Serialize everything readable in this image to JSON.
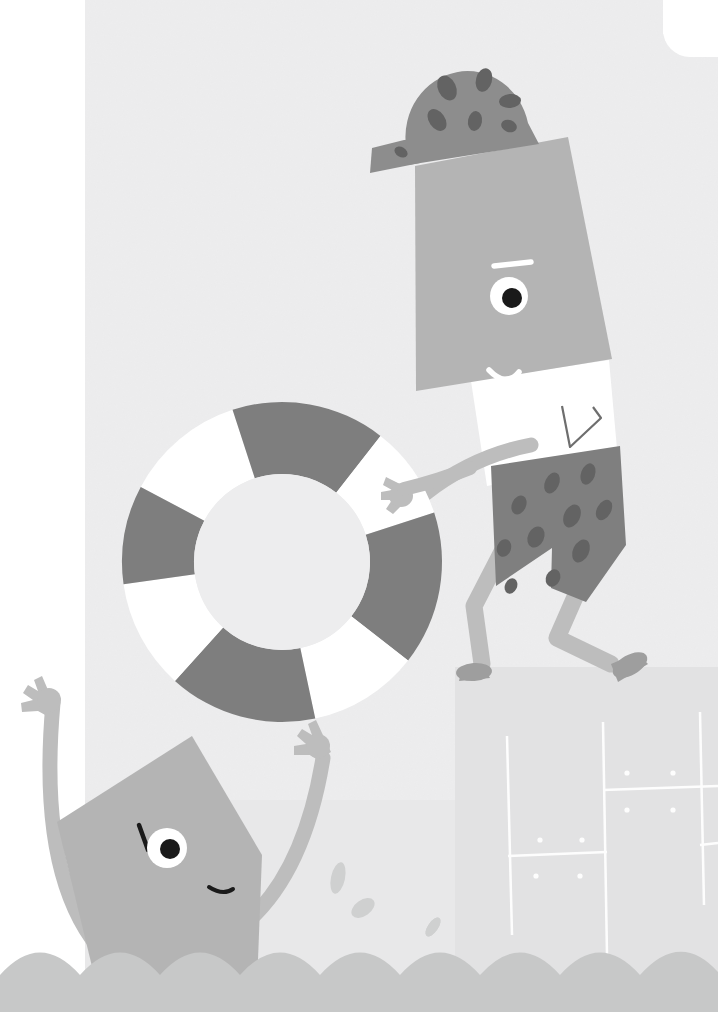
{
  "illustration": {
    "title": "Swimmers at the Pool with Life Ring",
    "scene_description": "Flat vector illustration: a character in spotted swim trunks and spotted cap steps off a pool deck holding a life ring while a second character in the water waves with both arms raised.",
    "canvas": {
      "width": 718,
      "height": 1012
    },
    "palette": {
      "page_white": "#ffffff",
      "background_paper": "#ededee",
      "deck_surface": "#e2e2e3",
      "water_light": "#e8e8e9",
      "wave_band": "#c7c8c8",
      "body_mid_gray": "#b4b4b4",
      "limb_gray": "#bdbdbd",
      "cap_gray": "#8d8d8d",
      "trunks_gray": "#7f7f7f",
      "spot_dark": "#636363",
      "ring_dark": "#7e7e7e",
      "ring_light": "#ffffff",
      "eye_white": "#ffffff",
      "pupil_black": "#1a1a1a",
      "brow_white": "#ffffff",
      "splash_gray": "#cfd0d0",
      "deck_line_white": "#ffffff"
    },
    "elements": [
      {
        "name": "background-paper",
        "label": "Textured off-white background panel"
      },
      {
        "name": "left-white-margin",
        "label": "White vertical margin strip on left edge"
      },
      {
        "name": "top-right-white-notch",
        "label": "White rounded notch in the top right corner"
      },
      {
        "name": "pool-deck",
        "label": "Pool deck platform with tile grid"
      },
      {
        "name": "deck-tile-grid",
        "label": "White tile lines and dot markers on the deck"
      },
      {
        "name": "water-surface",
        "label": "Light water surface band"
      },
      {
        "name": "wave-band",
        "label": "Scalloped wave band along the bottom"
      },
      {
        "name": "life-ring",
        "label": "Life preserver ring with four dark and four white segments"
      },
      {
        "name": "diver-character",
        "label": "Standing character stepping off the deck"
      },
      {
        "name": "diver-cap",
        "label": "Spotted swim cap"
      },
      {
        "name": "diver-eye",
        "label": "Round eye with black pupil"
      },
      {
        "name": "diver-eyebrow",
        "label": "White angled eyebrow"
      },
      {
        "name": "diver-smile",
        "label": "White curved smile"
      },
      {
        "name": "diver-collar",
        "label": "White collar / shirt wedge"
      },
      {
        "name": "diver-trunks",
        "label": "Dark spotted swim trunks"
      },
      {
        "name": "diver-arm",
        "label": "Arm reaching toward the life ring"
      },
      {
        "name": "diver-legs",
        "label": "Two bent legs with feet"
      },
      {
        "name": "swimmer-character",
        "label": "Character in the water with arms raised"
      },
      {
        "name": "swimmer-eye",
        "label": "Round eye with black pupil"
      },
      {
        "name": "swimmer-eyebrow",
        "label": "Dark angled eyebrow"
      },
      {
        "name": "swimmer-smile",
        "label": "Dark curved smile"
      },
      {
        "name": "swimmer-left-arm",
        "label": "Raised left arm with open hand"
      },
      {
        "name": "swimmer-right-arm",
        "label": "Raised right arm reaching the ring"
      },
      {
        "name": "splash-droplets",
        "label": "Three teardrop water droplets"
      }
    ],
    "ring_segments": [
      {
        "index": 0,
        "color": "#ffffff",
        "start_deg": -62,
        "end_deg": -18
      },
      {
        "index": 1,
        "color": "#7e7e7e",
        "start_deg": -18,
        "end_deg": 38
      },
      {
        "index": 2,
        "color": "#ffffff",
        "start_deg": 38,
        "end_deg": 72
      },
      {
        "index": 3,
        "color": "#7e7e7e",
        "start_deg": 72,
        "end_deg": 128
      },
      {
        "index": 4,
        "color": "#ffffff",
        "start_deg": 128,
        "end_deg": 168
      },
      {
        "index": 5,
        "color": "#7e7e7e",
        "start_deg": 168,
        "end_deg": 222
      },
      {
        "index": 6,
        "color": "#ffffff",
        "start_deg": 222,
        "end_deg": 262
      },
      {
        "index": 7,
        "color": "#7e7e7e",
        "start_deg": 262,
        "end_deg": 298
      }
    ],
    "cap_spots": [
      {
        "cx": 447,
        "cy": 88,
        "rx": 9,
        "ry": 13,
        "rot": -25
      },
      {
        "cx": 484,
        "cy": 80,
        "rx": 8,
        "ry": 12,
        "rot": 15
      },
      {
        "cx": 510,
        "cy": 101,
        "rx": 11,
        "ry": 7,
        "rot": -5
      },
      {
        "cx": 437,
        "cy": 120,
        "rx": 8,
        "ry": 12,
        "rot": -35
      },
      {
        "cx": 475,
        "cy": 121,
        "rx": 7,
        "ry": 10,
        "rot": 10
      },
      {
        "cx": 509,
        "cy": 126,
        "rx": 8,
        "ry": 6,
        "rot": 20
      },
      {
        "cx": 401,
        "cy": 152,
        "rx": 7,
        "ry": 5,
        "rot": 30
      }
    ],
    "trunks_spots": [
      {
        "cx": 552,
        "cy": 483,
        "rx": 7,
        "ry": 11,
        "rot": 25
      },
      {
        "cx": 588,
        "cy": 474,
        "rx": 7,
        "ry": 11,
        "rot": 20
      },
      {
        "cx": 519,
        "cy": 505,
        "rx": 7,
        "ry": 10,
        "rot": 25
      },
      {
        "cx": 572,
        "cy": 516,
        "rx": 8,
        "ry": 12,
        "rot": 25
      },
      {
        "cx": 604,
        "cy": 510,
        "rx": 7,
        "ry": 11,
        "rot": 30
      },
      {
        "cx": 536,
        "cy": 537,
        "rx": 8,
        "ry": 11,
        "rot": 25
      },
      {
        "cx": 581,
        "cy": 551,
        "rx": 8,
        "ry": 12,
        "rot": 25
      },
      {
        "cx": 504,
        "cy": 548,
        "rx": 7,
        "ry": 9,
        "rot": 20
      },
      {
        "cx": 553,
        "cy": 578,
        "rx": 7,
        "ry": 9,
        "rot": 25
      },
      {
        "cx": 511,
        "cy": 586,
        "rx": 6,
        "ry": 8,
        "rot": 25
      }
    ],
    "deck_dots": [
      {
        "cx": 627,
        "cy": 773
      },
      {
        "cx": 673,
        "cy": 773
      },
      {
        "cx": 627,
        "cy": 810
      },
      {
        "cx": 673,
        "cy": 810
      },
      {
        "cx": 540,
        "cy": 840
      },
      {
        "cx": 582,
        "cy": 840
      },
      {
        "cx": 536,
        "cy": 876
      },
      {
        "cx": 580,
        "cy": 876
      }
    ],
    "splash_droplets": [
      {
        "cx": 338,
        "cy": 878,
        "rx": 7,
        "ry": 16,
        "rot": 12
      },
      {
        "cx": 363,
        "cy": 908,
        "rx": 8,
        "ry": 13,
        "rot": 55
      },
      {
        "cx": 433,
        "cy": 927,
        "rx": 5,
        "ry": 11,
        "rot": 35
      }
    ]
  }
}
